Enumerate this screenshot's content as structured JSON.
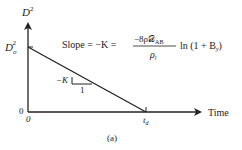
{
  "diagram": {
    "caption": "(a)",
    "y_axis": {
      "label_base": "D",
      "label_sup": "2"
    },
    "x_axis": {
      "label": "Time"
    },
    "y_intercept": {
      "label_base": "D",
      "label_sub": "o",
      "label_sup": "2"
    },
    "origin": {
      "y_label": "0",
      "x_label": "0"
    },
    "x_intercept": {
      "label_base": "t",
      "label_sub": "d"
    },
    "slope_triangle": {
      "rise_label": "−K",
      "run_label": "1"
    },
    "formula": {
      "prefix": "Slope = −K =",
      "numerator": "−8ρ𝒟",
      "numerator_sub": "AB",
      "denominator_base": "ρ",
      "denominator_sub": "l",
      "suffix_pre": "ln (1 + B",
      "suffix_sub": "y",
      "suffix_post": ")"
    },
    "colors": {
      "line": "#222222",
      "background": "#ffffff"
    }
  }
}
